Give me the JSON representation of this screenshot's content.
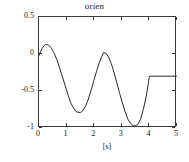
{
  "chart_data": {
    "type": "line",
    "title": "orien",
    "xlabel": "[s]",
    "ylabel": "[rad]",
    "xlim": [
      0,
      5
    ],
    "ylim": [
      -1,
      0.5
    ],
    "xticks": [
      "0",
      "1",
      "2",
      "3",
      "4",
      "5"
    ],
    "xtick_values": [
      0,
      1,
      2,
      3,
      4,
      5
    ],
    "yticks": [
      "0.5",
      "0",
      "-0.5",
      "-1"
    ],
    "ytick_values": [
      0.5,
      0,
      -0.5,
      -1
    ],
    "grid": false,
    "legend": null,
    "line_color": "#2b2b2b",
    "series": [
      {
        "name": "orien",
        "x": [
          0.0,
          0.1,
          0.2,
          0.27,
          0.35,
          0.45,
          0.55,
          0.65,
          0.75,
          0.85,
          0.95,
          1.05,
          1.15,
          1.25,
          1.35,
          1.45,
          1.5,
          1.58,
          1.68,
          1.78,
          1.88,
          1.98,
          2.08,
          2.18,
          2.28,
          2.34,
          2.42,
          2.52,
          2.62,
          2.72,
          2.82,
          2.92,
          3.02,
          3.12,
          3.22,
          3.32,
          3.42,
          3.5,
          3.58,
          3.68,
          3.78,
          3.88,
          3.96,
          4.0,
          4.2,
          4.4,
          4.6,
          4.8,
          5.0
        ],
        "y": [
          -0.02,
          0.07,
          0.12,
          0.13,
          0.12,
          0.08,
          0.01,
          -0.08,
          -0.19,
          -0.31,
          -0.43,
          -0.55,
          -0.66,
          -0.73,
          -0.78,
          -0.79,
          -0.79,
          -0.77,
          -0.71,
          -0.62,
          -0.5,
          -0.37,
          -0.24,
          -0.12,
          -0.03,
          0.02,
          0.01,
          -0.04,
          -0.13,
          -0.25,
          -0.39,
          -0.53,
          -0.66,
          -0.78,
          -0.88,
          -0.94,
          -0.97,
          -0.97,
          -0.95,
          -0.88,
          -0.75,
          -0.58,
          -0.4,
          -0.3,
          -0.3,
          -0.3,
          -0.3,
          -0.3,
          -0.3
        ]
      }
    ],
    "annotations": [
      {
        "text": "constant segment after t = 4 s at -0.30 rad",
        "x_start": 4.0,
        "x_end": 5.0,
        "y": -0.3
      }
    ]
  }
}
